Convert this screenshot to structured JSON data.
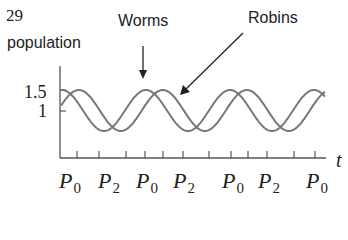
{
  "problem_number": "29",
  "chart_data": {
    "type": "line",
    "title": "",
    "xlabel": "t",
    "ylabel": "population",
    "yticks": [
      {
        "label": "1.5",
        "value": 1.5
      },
      {
        "label": "1",
        "value": 1
      }
    ],
    "xtick_labels": [
      "P0",
      "P2",
      "P0",
      "P2",
      "P0",
      "P2",
      "P0"
    ],
    "annotations": [
      {
        "text": "Worms",
        "arrow": "down",
        "target_series": "Worms"
      },
      {
        "text": "Robins",
        "arrow": "down-left",
        "target_series": "Robins"
      }
    ],
    "series": [
      {
        "name": "Worms",
        "shape": "periodic sinusoid",
        "max": 1.5,
        "min": 0.5,
        "period_units": 1,
        "peaks_at_x_labels": [
          "P0",
          "P0",
          "P0"
        ]
      },
      {
        "name": "Robins",
        "shape": "periodic sinusoid (lagging Worms)",
        "max": 1.5,
        "min": 0.5,
        "period_units": 1,
        "phase_lag": 0.2
      }
    ],
    "grid": false,
    "legend": "none (inline arrow labels)"
  },
  "labels": {
    "ylabel": "population",
    "worms": "Worms",
    "robins": "Robins",
    "ytick_high": "1.5",
    "ytick_low": "1",
    "xvar": "t"
  },
  "xticks": [
    {
      "letter": "P",
      "sub": "0"
    },
    {
      "letter": "P",
      "sub": "2"
    },
    {
      "letter": "P",
      "sub": "0"
    },
    {
      "letter": "P",
      "sub": "2"
    },
    {
      "letter": "P",
      "sub": "0"
    },
    {
      "letter": "P",
      "sub": "2"
    },
    {
      "letter": "P",
      "sub": "0"
    }
  ]
}
